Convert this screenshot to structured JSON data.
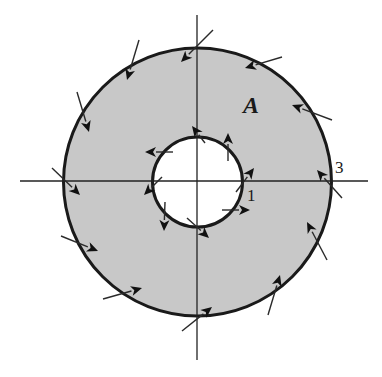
{
  "figure": {
    "colors": {
      "background": "#ffffff",
      "annulus_fill": "#c8c8c8",
      "stroke": "#1a1a1a"
    },
    "center": [
      197.5,
      182
    ],
    "outer_radius": 134,
    "inner_radius": 45,
    "axes": {
      "horizontal": {
        "x1": 20,
        "x2": 368,
        "y": 181
      },
      "vertical": {
        "x": 197,
        "y1": 15,
        "y2": 360
      }
    },
    "labels": {
      "region": {
        "text": "A",
        "x": 243,
        "y": 92
      },
      "inner_radius_label": {
        "text": "1",
        "x": 247,
        "y": 186
      },
      "outer_radius_label": {
        "text": "3",
        "x": 335,
        "y": 158
      }
    },
    "outer_arrows": [
      {
        "from": [
          139,
          40
        ],
        "to": [
          127,
          80
        ]
      },
      {
        "from": [
          213,
          30
        ],
        "to": [
          181,
          62
        ]
      },
      {
        "from": [
          282,
          57
        ],
        "to": [
          245,
          68
        ]
      },
      {
        "from": [
          332,
          120
        ],
        "to": [
          292,
          105
        ]
      },
      {
        "from": [
          77,
          92
        ],
        "to": [
          89,
          132
        ]
      },
      {
        "from": [
          52,
          168
        ],
        "to": [
          80,
          195
        ]
      },
      {
        "from": [
          61,
          236
        ],
        "to": [
          98,
          251
        ]
      },
      {
        "from": [
          103,
          299
        ],
        "to": [
          142,
          288
        ]
      },
      {
        "from": [
          182,
          331
        ],
        "to": [
          212,
          307
        ]
      },
      {
        "from": [
          268,
          315
        ],
        "to": [
          280,
          275
        ]
      },
      {
        "from": [
          327,
          260
        ],
        "to": [
          307,
          222
        ]
      },
      {
        "from": [
          342,
          198
        ],
        "to": [
          317,
          170
        ]
      }
    ],
    "inner_arrows": [
      {
        "from": [
          173,
          152
        ],
        "to": [
          145,
          152
        ]
      },
      {
        "from": [
          205,
          143
        ],
        "to": [
          192,
          126
        ]
      },
      {
        "from": [
          228,
          161
        ],
        "to": [
          228,
          133
        ]
      },
      {
        "from": [
          236,
          192
        ],
        "to": [
          254,
          168
        ]
      },
      {
        "from": [
          222,
          210
        ],
        "to": [
          250,
          210
        ]
      },
      {
        "from": [
          187,
          218
        ],
        "to": [
          209,
          238
        ]
      },
      {
        "from": [
          165,
          202
        ],
        "to": [
          164,
          231
        ]
      },
      {
        "from": [
          162,
          177
        ],
        "to": [
          144,
          195
        ]
      }
    ]
  }
}
